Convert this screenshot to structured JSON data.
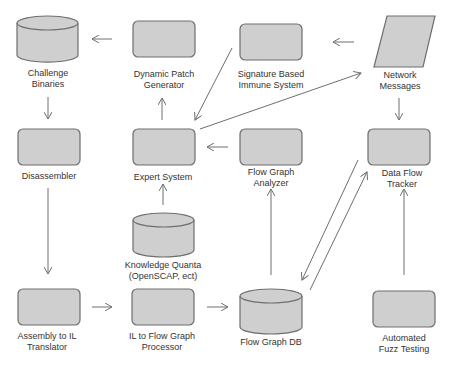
{
  "diagram": {
    "nodes": {
      "challenge_binaries": {
        "label_1": "Challenge",
        "label_2": "Binaries",
        "shape": "cylinder"
      },
      "dynamic_patch_generator": {
        "label_1": "Dynamic Patch",
        "label_2": "Generator",
        "shape": "rounded-rect"
      },
      "signature_immune_system": {
        "label_1": "Signature Based",
        "label_2": "Immune System",
        "shape": "rounded-rect"
      },
      "network_messages": {
        "label_1": "Network",
        "label_2": "Messages",
        "shape": "parallelogram"
      },
      "disassembler": {
        "label_1": "Disassembler",
        "shape": "rounded-rect"
      },
      "expert_system": {
        "label_1": "Expert System",
        "shape": "rounded-rect"
      },
      "flow_graph_analyzer": {
        "label_1": "Flow Graph",
        "label_2": "Analyzer",
        "shape": "rounded-rect"
      },
      "data_flow_tracker": {
        "label_1": "Data Flow",
        "label_2": "Tracker",
        "shape": "rounded-rect"
      },
      "knowledge_quanta": {
        "label_1": "Knowledge Quanta",
        "label_2": "(OpenSCAP, ect)",
        "shape": "cylinder"
      },
      "assembly_to_il": {
        "label_1": "Assembly to IL",
        "label_2": "Translator",
        "shape": "rounded-rect"
      },
      "il_to_flow_graph": {
        "label_1": "IL to Flow Graph",
        "label_2": "Processor",
        "shape": "rounded-rect"
      },
      "flow_graph_db": {
        "label_1": "Flow Graph DB",
        "shape": "cylinder"
      },
      "automated_fuzz": {
        "label_1": "Automated",
        "label_2": "Fuzz Testing",
        "shape": "rounded-rect"
      }
    },
    "edges": [
      [
        "dynamic_patch_generator",
        "challenge_binaries"
      ],
      [
        "signature_immune_system",
        "expert_system"
      ],
      [
        "network_messages",
        "signature_immune_system"
      ],
      [
        "expert_system",
        "network_messages"
      ],
      [
        "challenge_binaries",
        "disassembler"
      ],
      [
        "expert_system",
        "dynamic_patch_generator"
      ],
      [
        "network_messages",
        "data_flow_tracker"
      ],
      [
        "flow_graph_analyzer",
        "expert_system"
      ],
      [
        "knowledge_quanta",
        "expert_system"
      ],
      [
        "disassembler",
        "assembly_to_il"
      ],
      [
        "assembly_to_il",
        "il_to_flow_graph"
      ],
      [
        "il_to_flow_graph",
        "flow_graph_db"
      ],
      [
        "flow_graph_db",
        "flow_graph_analyzer"
      ],
      [
        "flow_graph_db",
        "data_flow_tracker"
      ],
      [
        "data_flow_tracker",
        "flow_graph_db"
      ],
      [
        "automated_fuzz",
        "data_flow_tracker"
      ]
    ],
    "colors": {
      "fill": "#cfcfcf",
      "stroke": "#6e6e6e",
      "arrow": "#6e6e6e",
      "text": "#333333"
    }
  }
}
